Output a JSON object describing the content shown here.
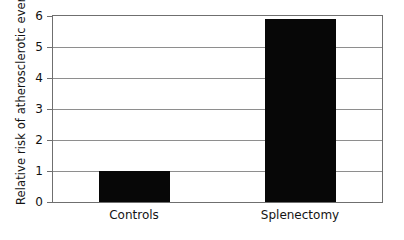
{
  "chart_data": {
    "type": "bar",
    "title": "",
    "subtitle": "",
    "xlabel": "",
    "ylabel": "Relative risk of atherosclerotic events",
    "categories": [
      "Controls",
      "Splenectomy"
    ],
    "values": [
      1.0,
      5.9
    ],
    "series": [
      {
        "name": "Relative risk",
        "values": [
          1.0,
          5.9
        ]
      }
    ],
    "ylim": [
      0,
      6
    ],
    "yticks": [
      0,
      1,
      2,
      3,
      4,
      5,
      6
    ],
    "ytick_labels": [
      "0",
      "1",
      "2",
      "3",
      "4",
      "5",
      "6"
    ],
    "grid": true,
    "grid_axis": "y",
    "legend": false,
    "legend_position": "none",
    "bar_color": "#070707",
    "grid_color": "#8e8e8e",
    "frame_color": "#6f6f6f",
    "background_color": "#ffffff",
    "annotations": []
  },
  "axis": {
    "y_title": "Relative risk of atherosclerotic events",
    "tick_0": "0",
    "tick_1": "1",
    "tick_2": "2",
    "tick_3": "3",
    "tick_4": "4",
    "tick_5": "5",
    "tick_6": "6"
  },
  "categories": {
    "controls": "Controls",
    "splenectomy": "Splenectomy"
  }
}
